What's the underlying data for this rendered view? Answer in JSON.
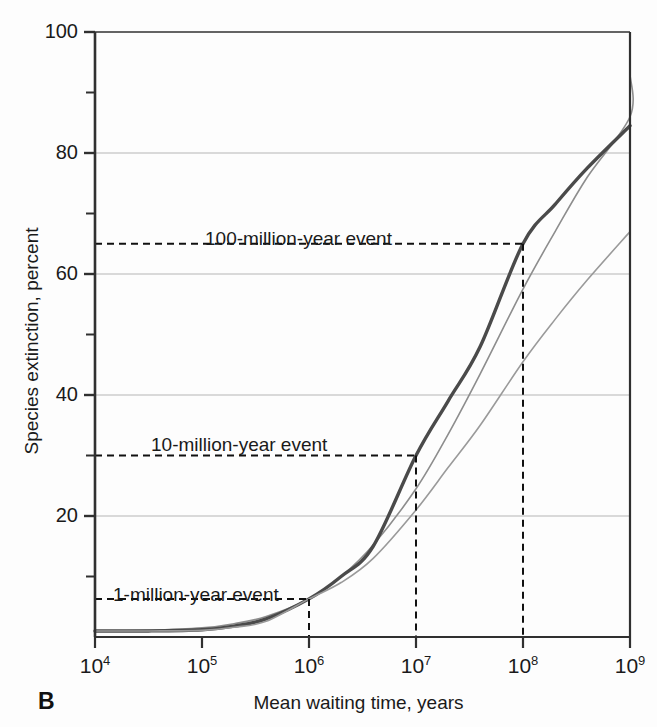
{
  "figure": {
    "panel_letter": "B",
    "background_color": "#fdfdfd"
  },
  "chart_data": {
    "type": "line",
    "title": "",
    "xlabel": "Mean waiting time, years",
    "ylabel": "Species extinction, percent",
    "x_scale": "log10",
    "xlim": [
      10000,
      1000000000
    ],
    "ylim": [
      0,
      100
    ],
    "x_ticks": [
      {
        "value": 10000,
        "label": "10",
        "exponent": "4"
      },
      {
        "value": 100000,
        "label": "10",
        "exponent": "5"
      },
      {
        "value": 1000000,
        "label": "10",
        "exponent": "6"
      },
      {
        "value": 10000000,
        "label": "10",
        "exponent": "7"
      },
      {
        "value": 100000000,
        "label": "10",
        "exponent": "8"
      },
      {
        "value": 1000000000,
        "label": "10",
        "exponent": "9"
      }
    ],
    "y_ticks_major": [
      100,
      80,
      60,
      40,
      20
    ],
    "y_ticks_minor": [
      90,
      70,
      50,
      30,
      10
    ],
    "grid": {
      "x": false,
      "y": true,
      "y_grid_values": [
        80,
        60,
        40,
        20
      ],
      "color": "#b5b5b5"
    },
    "legend": {
      "visible": false,
      "position": "none"
    },
    "series": [
      {
        "name": "upper bound",
        "color": "#8d8d8d",
        "width": 1.6,
        "points": [
          [
            4.0,
            1.0
          ],
          [
            4.5,
            1.1
          ],
          [
            5.0,
            1.5
          ],
          [
            5.3,
            2.2
          ],
          [
            5.6,
            3.4
          ],
          [
            6.0,
            6.3
          ],
          [
            6.3,
            10.0
          ],
          [
            6.6,
            15.2
          ],
          [
            7.0,
            24.5
          ],
          [
            7.3,
            33.5
          ],
          [
            7.6,
            43.5
          ],
          [
            8.0,
            57.5
          ],
          [
            8.3,
            67.0
          ],
          [
            8.6,
            76.0
          ],
          [
            9.0,
            86.0
          ],
          [
            9.0,
            93.0
          ]
        ],
        "endpoint_value": 93.0
      },
      {
        "name": "central estimate",
        "color": "#4a4a4a",
        "width": 3.4,
        "points": [
          [
            4.0,
            1.0
          ],
          [
            4.5,
            1.0
          ],
          [
            5.0,
            1.2
          ],
          [
            5.3,
            1.8
          ],
          [
            5.6,
            3.0
          ],
          [
            6.0,
            6.3
          ],
          [
            6.3,
            10.0
          ],
          [
            6.6,
            15.0
          ],
          [
            7.0,
            30.0
          ],
          [
            7.3,
            39.0
          ],
          [
            7.6,
            48.0
          ],
          [
            8.0,
            65.0
          ],
          [
            8.3,
            71.5
          ],
          [
            8.6,
            77.5
          ],
          [
            9.0,
            84.5
          ]
        ],
        "endpoint_value": 84.5
      },
      {
        "name": "lower bound",
        "color": "#9a9a9a",
        "width": 1.6,
        "points": [
          [
            4.0,
            1.0
          ],
          [
            4.5,
            1.0
          ],
          [
            5.0,
            1.1
          ],
          [
            5.3,
            1.6
          ],
          [
            5.6,
            2.6
          ],
          [
            6.0,
            6.3
          ],
          [
            6.3,
            9.0
          ],
          [
            6.6,
            13.0
          ],
          [
            7.0,
            21.0
          ],
          [
            7.3,
            28.0
          ],
          [
            7.6,
            35.0
          ],
          [
            8.0,
            45.5
          ],
          [
            8.3,
            52.5
          ],
          [
            8.6,
            59.0
          ],
          [
            9.0,
            67.0
          ]
        ],
        "endpoint_value": 67.0
      }
    ],
    "annotations": [
      {
        "id": "event-100my",
        "label": "100-million-year event",
        "x_value": 100000000,
        "y_value": 65,
        "label_x_px": 205,
        "label_y_px": 228
      },
      {
        "id": "event-10my",
        "label": "10-million-year event",
        "x_value": 10000000,
        "y_value": 30,
        "label_x_px": 151,
        "label_y_px": 434
      },
      {
        "id": "event-1my",
        "label": "1-million-year event",
        "x_value": 1000000,
        "y_value": 6.3,
        "label_x_px": 113,
        "label_y_px": 584
      }
    ]
  }
}
